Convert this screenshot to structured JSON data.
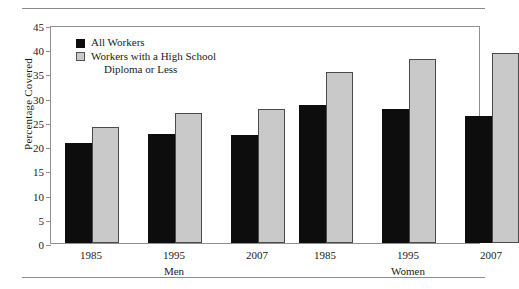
{
  "chart_data": {
    "type": "bar",
    "title": "",
    "xlabel": "",
    "ylabel": "Percentage Covered",
    "ylim": [
      0,
      45
    ],
    "yticks": [
      0,
      5,
      10,
      15,
      20,
      25,
      30,
      35,
      40,
      45
    ],
    "grid": false,
    "legend_position": "upper-left-inside",
    "groups": [
      {
        "name": "Men",
        "categories": [
          "1985",
          "1995",
          "2007"
        ]
      },
      {
        "name": "Women",
        "categories": [
          "1985",
          "1995",
          "2007"
        ]
      }
    ],
    "categories": [
      "1985",
      "1995",
      "2007",
      "1985",
      "1995",
      "2007"
    ],
    "series": [
      {
        "name": "All Workers",
        "color": "#0d0d0d",
        "values": [
          20.7,
          22.5,
          22.3,
          28.4,
          27.6,
          26.3
        ]
      },
      {
        "name": "Workers with a High School Diploma or Less",
        "color": "#c9c9c9",
        "values": [
          24.0,
          26.8,
          27.6,
          35.4,
          38.0,
          39.2
        ]
      }
    ]
  },
  "legend": {
    "items": [
      {
        "label": "All Workers",
        "continuation": ""
      },
      {
        "label": "Workers with a High School",
        "continuation": "Diploma or Less"
      }
    ]
  },
  "axis": {
    "y_title": "Percentage Covered"
  }
}
